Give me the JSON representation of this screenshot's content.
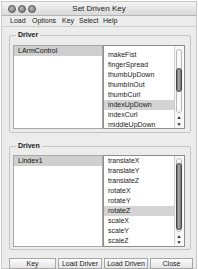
{
  "window": {
    "title": "Set Driven Key",
    "traffic_lights": [
      "close",
      "minimize",
      "zoom"
    ]
  },
  "menubar": {
    "items": [
      "Load",
      "Options",
      "Key",
      "Select",
      "Help"
    ]
  },
  "driver": {
    "label": "Driver",
    "objects": [
      "LArmControl"
    ],
    "selected_object": "LArmControl",
    "attributes": [
      "makeFist",
      "fingerSpread",
      "thumbUpDown",
      "thumbInOut",
      "thumbCurl",
      "indexUpDown",
      "indexCurl",
      "middleUpDown"
    ],
    "selected_attribute": "indexUpDown"
  },
  "driven": {
    "label": "Driven",
    "objects": [
      "Lindex1"
    ],
    "selected_object": "Lindex1",
    "attributes": [
      "translateX",
      "translateY",
      "translateZ",
      "rotateX",
      "rotateY",
      "rotateZ",
      "scaleX",
      "scaleY",
      "scaleZ"
    ],
    "selected_attribute": "rotateZ"
  },
  "buttons": {
    "key": "Key",
    "load_driver": "Load Driver",
    "load_driven": "Load Driven",
    "close": "Close"
  },
  "scroll_arrows": {
    "up": "▲",
    "down": "▼"
  }
}
